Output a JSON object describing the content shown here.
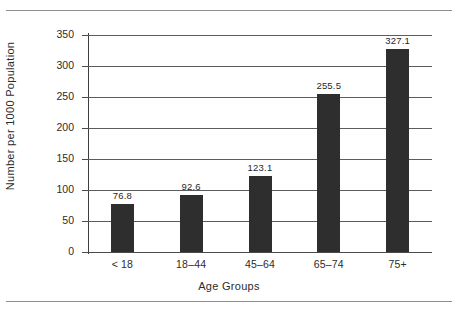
{
  "chart_data": {
    "type": "bar",
    "title": "",
    "xlabel": "Age Groups",
    "ylabel": "Number per 1000 Population",
    "categories": [
      "< 18",
      "18–44",
      "45–64",
      "65–74",
      "75+"
    ],
    "values": [
      76.8,
      92.6,
      123.1,
      255.5,
      327.1
    ],
    "value_labels": [
      "76.8",
      "92.6",
      "123.1",
      "255.5",
      "327.1"
    ],
    "ylim": [
      0,
      350
    ],
    "ytick_values": [
      0,
      50,
      100,
      150,
      200,
      250,
      300,
      350
    ],
    "ytick_labels": [
      "0",
      "50",
      "100",
      "150",
      "200",
      "250",
      "300",
      "350"
    ],
    "grid": true,
    "legend": false,
    "legend_position": "none",
    "bar_color": "#2e2e2e",
    "gridline_color": "#5c5c5c",
    "axis_color": "#3d3d3d",
    "background_color": "#ffffff"
  }
}
